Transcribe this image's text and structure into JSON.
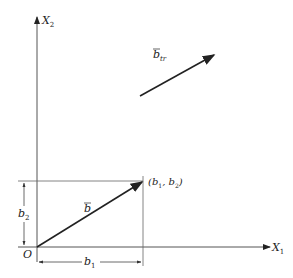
{
  "diagram": {
    "axes": {
      "x_label": "X",
      "x_sub": "1",
      "y_label": "X",
      "y_sub": "2",
      "origin_label": "O"
    },
    "vector_b": {
      "label": "b",
      "bar": "¯"
    },
    "vector_btr": {
      "label": "b",
      "sub": "tr"
    },
    "point_label": "(b",
    "point_sub1": "1",
    "point_mid": ", b",
    "point_sub2": "2",
    "point_close": ")",
    "dim_b1": {
      "label": "b",
      "sub": "1"
    },
    "dim_b2": {
      "label": "b",
      "sub": "2"
    },
    "colors": {
      "line": "#222222",
      "thin": "#555555"
    }
  }
}
